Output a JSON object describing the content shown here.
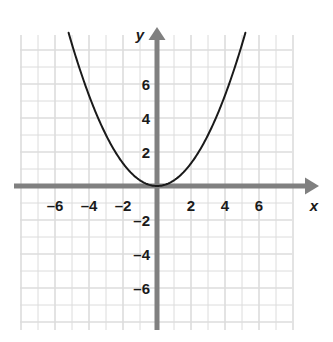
{
  "figure": {
    "background_color": "#ffffff",
    "axis_color": "#808080",
    "grid_color": "#dcdcdc",
    "curve_color": "#1a1a1a",
    "label_color": "#1a1a1a"
  },
  "chart_data": {
    "type": "line",
    "title": "",
    "xlabel": "x",
    "ylabel": "y",
    "equation": "y = x^2/3",
    "grid": true,
    "legend": null,
    "xlim": [
      -8,
      8
    ],
    "ylim": [
      -8,
      8
    ],
    "grid_step": 1,
    "xticks": [
      -6,
      -4,
      -2,
      2,
      4,
      6
    ],
    "yticks": [
      -6,
      -4,
      -2,
      2,
      4,
      6
    ],
    "xtick_labels": [
      "–6",
      "–4",
      "–2",
      "2",
      "4",
      "6"
    ],
    "ytick_labels": [
      "–6",
      "–4",
      "–2",
      "2",
      "4",
      "6"
    ],
    "series": [
      {
        "name": "parabola",
        "kind": "parabola",
        "vertex": [
          0,
          0
        ],
        "coefficient": 0.3333,
        "x": [
          -5.2,
          -4.8,
          -4.4,
          -4.0,
          -3.6,
          -3.2,
          -2.8,
          -2.4,
          -2.0,
          -1.6,
          -1.2,
          -0.8,
          -0.4,
          0.0,
          0.4,
          0.8,
          1.2,
          1.6,
          2.0,
          2.4,
          2.8,
          3.2,
          3.6,
          4.0,
          4.4,
          4.8,
          5.2
        ],
        "values": [
          9.01,
          7.68,
          6.45,
          5.33,
          4.32,
          3.41,
          2.61,
          1.92,
          1.33,
          0.85,
          0.48,
          0.21,
          0.05,
          0.0,
          0.05,
          0.21,
          0.48,
          0.85,
          1.33,
          1.92,
          2.61,
          3.41,
          4.32,
          5.33,
          6.45,
          7.68,
          9.01
        ]
      }
    ]
  },
  "axes": {
    "x_axis_label": "x",
    "y_axis_label": "y"
  }
}
